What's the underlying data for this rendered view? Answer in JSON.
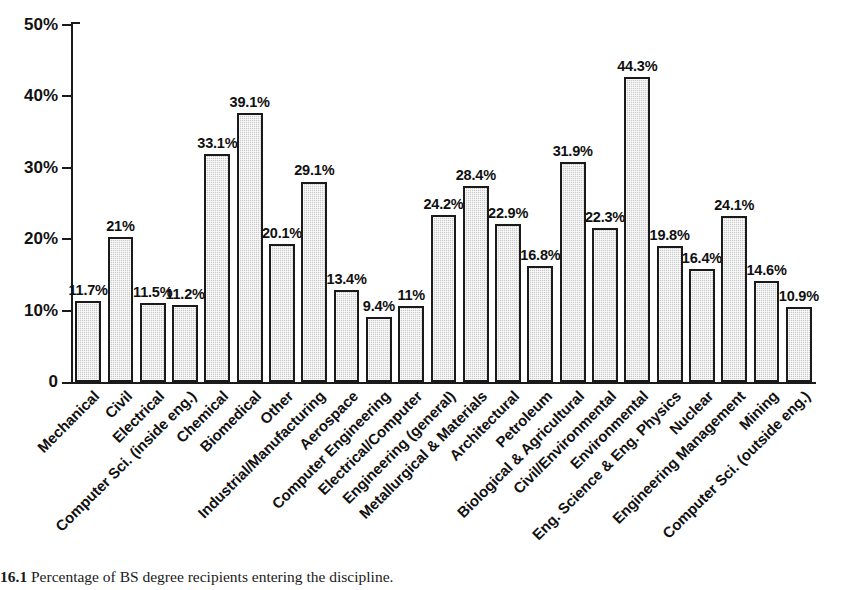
{
  "figure": {
    "caption_number": "16.1",
    "caption_text": "Percentage of BS degree recipients entering the discipline."
  },
  "chart_data": {
    "type": "bar",
    "title": "",
    "xlabel": "",
    "ylabel": "",
    "ylim": [
      0,
      50
    ],
    "grid": false,
    "legend": "none",
    "y_tick_labels": [
      "0",
      "10%",
      "20%",
      "30%",
      "40%",
      "50%"
    ],
    "y_tick_values": [
      0,
      10,
      20,
      30,
      40,
      50
    ],
    "value_label_suffix": "%",
    "bar_fill_color": "#c9c9c9",
    "bar_edge_color": "#1a1a1a",
    "categories": [
      "Mechanical",
      "Civil",
      "Electrical",
      "Computer Sci. (inside eng.)",
      "Chemical",
      "Biomedical",
      "Other",
      "Industrial/Manufacturing",
      "Aerospace",
      "Computer Engineering",
      "Electrical/Computer",
      "Engineering (general)",
      "Metallurgical & Materials",
      "Architectural",
      "Petroleum",
      "Biological & Agricultural",
      "Civil/Environmental",
      "Environmental",
      "Eng. Science & Eng. Physics",
      "Nuclear",
      "Engineering Management",
      "Mining",
      "Computer Sci. (outside eng.)"
    ],
    "values": [
      11.7,
      21,
      11.5,
      11.2,
      33.1,
      39.1,
      20.1,
      29.1,
      13.4,
      9.4,
      11,
      24.2,
      28.4,
      22.9,
      16.8,
      31.9,
      22.3,
      44.3,
      19.8,
      16.4,
      24.1,
      14.6,
      10.9
    ],
    "value_labels": [
      "11.7%",
      "21%",
      "11.5%",
      "11.2%",
      "33.1%",
      "39.1%",
      "20.1%",
      "29.1%",
      "13.4%",
      "9.4%",
      "11%",
      "24.2%",
      "28.4%",
      "22.9%",
      "16.8%",
      "31.9%",
      "22.3%",
      "44.3%",
      "19.8%",
      "16.4%",
      "24.1%",
      "14.6%",
      "10.9%"
    ]
  }
}
